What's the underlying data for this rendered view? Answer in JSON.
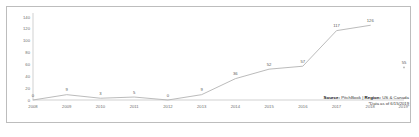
{
  "chart_data": {
    "type": "line",
    "title": "",
    "xlabel": "",
    "ylabel": "",
    "ylim": [
      0,
      140
    ],
    "yticks": [
      0,
      20,
      40,
      60,
      80,
      100,
      120,
      140
    ],
    "grid": false,
    "legend": "none",
    "categories": [
      "2008",
      "2009",
      "2010",
      "2011",
      "2012",
      "2013",
      "2014",
      "2015",
      "2016",
      "2017",
      "2018",
      "2019*"
    ],
    "values": [
      0,
      9,
      3,
      5,
      0,
      9,
      36,
      52,
      57,
      117,
      126,
      55
    ],
    "data_labels": [
      "0",
      "9",
      "3",
      "5",
      "0",
      "9",
      "36",
      "52",
      "57",
      "117",
      "126",
      "55"
    ],
    "series": [
      {
        "name": "Deal count",
        "connected_through_index": 10,
        "values": [
          0,
          9,
          3,
          5,
          0,
          9,
          36,
          52,
          57,
          117,
          126,
          55
        ]
      }
    ],
    "last_point_detached": true,
    "line_color": "#b3b3b3",
    "label_color": "#5a5a5a",
    "axis_color": "#bdbdbd"
  },
  "footer": {
    "source_label": "Source:",
    "source_value": "PitchBook",
    "separator": "|",
    "region_label": "Region:",
    "region_value": "US & Canada",
    "note": "*Data as of 6/15/2019"
  }
}
